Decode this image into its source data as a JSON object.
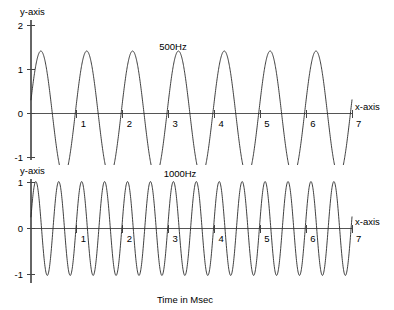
{
  "figure": {
    "background_color": "#ffffff",
    "line_color": "#2a2a2a",
    "axis_color": "#555555",
    "caption": "Time in Msec"
  },
  "chart_data": [
    {
      "type": "line",
      "title": "500Hz",
      "xlabel": "x-axis",
      "ylabel": "y-axis",
      "xlim": [
        0,
        7
      ],
      "ylim": [
        -1.7,
        2.2
      ],
      "xticks": [
        1,
        2,
        3,
        4,
        5,
        6,
        7
      ],
      "xtick_labels": [
        "1",
        "2",
        "3",
        "4",
        "5",
        "6",
        "7"
      ],
      "yticks": [
        2,
        1,
        0,
        -1
      ],
      "ytick_labels": [
        "2",
        "1",
        "0",
        "-1"
      ],
      "grid": false,
      "legend": "none",
      "series": [
        {
          "name": "500Hz",
          "waveform": "sine",
          "amplitude": 1.42,
          "cycles_over_range": 7,
          "frequency_cycles_per_msec": 1,
          "phase_offset": 0.22,
          "peaks_y": [
            1.42,
            1.42,
            1.42,
            1.42,
            1.42,
            1.42,
            1.42
          ],
          "troughs_y": [
            -1.42,
            -1.42,
            -1.42,
            -1.42,
            -1.42,
            -1.42,
            -1.42
          ],
          "zero_crossings_x": [
            0.5,
            1.0,
            1.5,
            2.0,
            2.5,
            3.0,
            3.5,
            4.0,
            4.5,
            5.0,
            5.5,
            6.0,
            6.5,
            7.0
          ]
        }
      ]
    },
    {
      "type": "line",
      "title": "1000Hz",
      "xlabel": "x-axis",
      "ylabel": "y-axis",
      "xlim": [
        0,
        7
      ],
      "ylim": [
        -1.35,
        1.3
      ],
      "xticks": [
        1,
        2,
        3,
        4,
        5,
        6,
        7
      ],
      "xtick_labels": [
        "1",
        "2",
        "3",
        "4",
        "5",
        "6",
        "7"
      ],
      "yticks": [
        1,
        0,
        -1
      ],
      "ytick_labels": [
        "1",
        "0",
        "-1"
      ],
      "grid": false,
      "legend": "none",
      "series": [
        {
          "name": "1000Hz",
          "waveform": "sine",
          "amplitude": 1.02,
          "cycles_over_range": 14,
          "frequency_cycles_per_msec": 2,
          "phase_offset": 0.25,
          "peaks_y": [
            0.9,
            0.9,
            0.9,
            0.9,
            0.9,
            0.9,
            0.9,
            0.9,
            0.9,
            0.9,
            0.9,
            0.9,
            0.9,
            0.9
          ],
          "troughs_y": [
            -1.15,
            -1.15,
            -1.15,
            -1.15,
            -1.15,
            -1.15,
            -1.15,
            -1.15,
            -1.15,
            -1.15,
            -1.15,
            -1.15,
            -1.15,
            -1.15
          ],
          "zero_crossings_x": [
            0.25,
            0.5,
            0.75,
            1.0,
            1.25,
            1.5,
            1.75,
            2.0,
            2.25,
            2.5,
            2.75,
            3.0,
            3.25,
            3.5,
            3.75,
            4.0,
            4.25,
            4.5,
            4.75,
            5.0,
            5.25,
            5.5,
            5.75,
            6.0,
            6.25,
            6.5,
            6.75,
            7.0
          ]
        }
      ]
    }
  ]
}
